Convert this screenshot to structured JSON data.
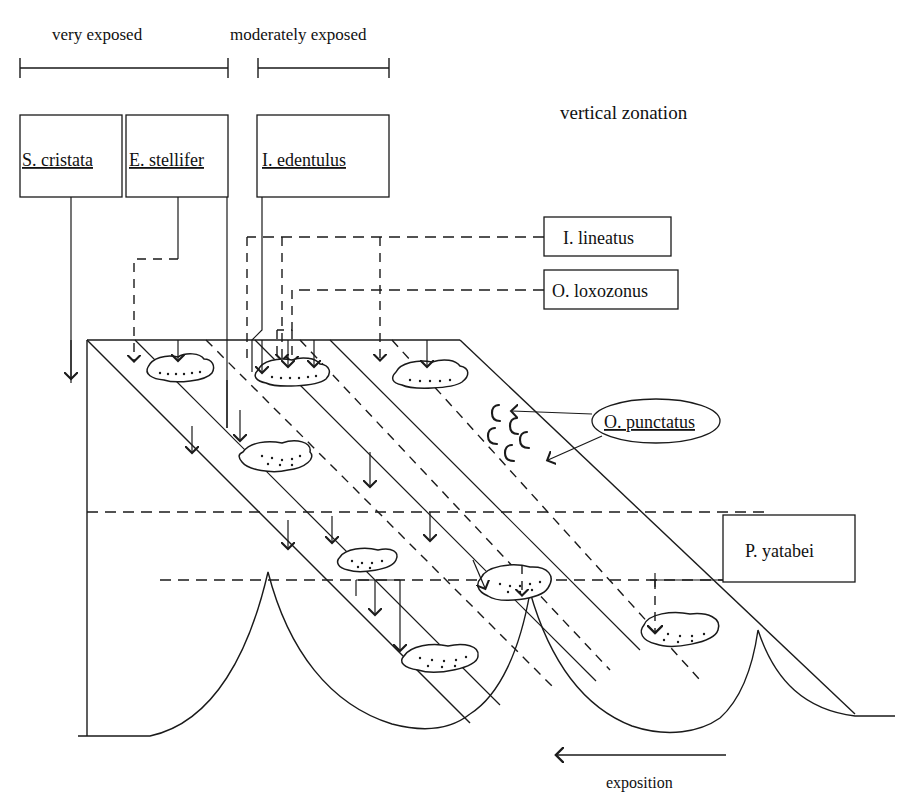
{
  "figure": {
    "title": "vertical zonation",
    "exposure_headers": [
      {
        "id": "very-exposed",
        "label": "very exposed"
      },
      {
        "id": "moderately-exposed",
        "label": "moderately exposed"
      }
    ],
    "bottom_axis": {
      "label": "exposition",
      "direction": "left-arrow"
    },
    "species_boxes": [
      {
        "id": "s-cristata",
        "label": "S. cristata",
        "underlined": true
      },
      {
        "id": "e-stellifer",
        "label": "E. stellifer",
        "underlined": true
      },
      {
        "id": "i-edentulus",
        "label": "I. edentulus",
        "underlined": true
      },
      {
        "id": "i-lineatus",
        "label": "I.  lineatus",
        "underlined": false
      },
      {
        "id": "o-loxozonus",
        "label": "O. loxozonus",
        "underlined": false
      },
      {
        "id": "p-yatabei",
        "label": "P. yatabei",
        "underlined": false
      }
    ],
    "species_ellipse": {
      "id": "o-punctatus",
      "label": "O. punctatus",
      "underlined": true
    },
    "colors": {
      "ink": "#1a1a1a",
      "paper": "#ffffff"
    }
  }
}
